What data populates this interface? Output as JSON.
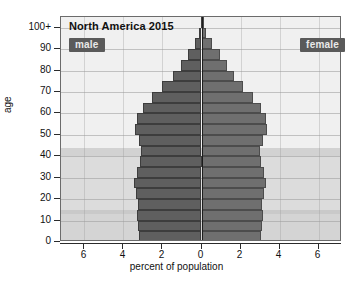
{
  "chart_data": {
    "type": "bar",
    "title": "North America 2015",
    "xlabel": "percent of population",
    "ylabel": "age",
    "xlim": [
      -7.2,
      7.2
    ],
    "ylim": [
      0,
      105
    ],
    "grid": true,
    "legend_position": "inside-top-left-and-top-right",
    "orientation": "horizontal-diverging",
    "categories": [
      "0",
      "5",
      "10",
      "15",
      "20",
      "25",
      "30",
      "35",
      "40",
      "45",
      "50",
      "55",
      "60",
      "65",
      "70",
      "75",
      "80",
      "85",
      "90",
      "95",
      "100+"
    ],
    "series": [
      {
        "name": "male",
        "side": "left",
        "values": [
          3.2,
          3.25,
          3.3,
          3.25,
          3.35,
          3.45,
          3.3,
          3.15,
          3.1,
          3.2,
          3.4,
          3.3,
          3.0,
          2.55,
          2.0,
          1.45,
          1.05,
          0.7,
          0.35,
          0.12,
          0.04
        ]
      },
      {
        "name": "female",
        "side": "right",
        "values": [
          3.05,
          3.1,
          3.15,
          3.1,
          3.2,
          3.3,
          3.2,
          3.05,
          3.0,
          3.15,
          3.35,
          3.3,
          3.05,
          2.65,
          2.15,
          1.65,
          1.3,
          0.95,
          0.55,
          0.22,
          0.08
        ]
      }
    ],
    "x_ticks": [
      {
        "value": -6,
        "label": "6"
      },
      {
        "value": -4,
        "label": "4"
      },
      {
        "value": -2,
        "label": "2"
      },
      {
        "value": 0,
        "label": "0"
      },
      {
        "value": 2,
        "label": "2"
      },
      {
        "value": 4,
        "label": "4"
      },
      {
        "value": 6,
        "label": "6"
      }
    ],
    "y_ticks": [
      {
        "value": 0,
        "label": "0"
      },
      {
        "value": 10,
        "label": "10"
      },
      {
        "value": 20,
        "label": "20"
      },
      {
        "value": 30,
        "label": "30"
      },
      {
        "value": 40,
        "label": "40"
      },
      {
        "value": 50,
        "label": "50"
      },
      {
        "value": 60,
        "label": "60"
      },
      {
        "value": 70,
        "label": "70"
      },
      {
        "value": 80,
        "label": "80"
      },
      {
        "value": 90,
        "label": "90"
      },
      {
        "value": 100,
        "label": "100+"
      }
    ],
    "background_bands": [
      {
        "from": 0,
        "to": 13,
        "shade": "#d4d4d4"
      },
      {
        "from": 13,
        "to": 15,
        "shade": "#c9c9c9"
      },
      {
        "from": 15,
        "to": 40,
        "shade": "#dcdcdc"
      },
      {
        "from": 40,
        "to": 44,
        "shade": "#d2d2d2"
      },
      {
        "from": 44,
        "to": 105,
        "shade": "#f0f0f0"
      }
    ],
    "colors": {
      "male_bar": "#5f5f5f",
      "female_bar": "#6f6f6f",
      "badge_bg": "#5a5a5a",
      "badge_text": "#e9e9e9",
      "plot_bg": "#f2f2f2",
      "axis": "#2b2b2b",
      "gridline": "#9a9a9a"
    }
  },
  "legend": {
    "male_label": "male",
    "female_label": "female"
  }
}
